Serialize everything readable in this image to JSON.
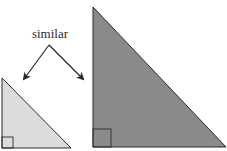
{
  "diagram": {
    "label": "similar",
    "colors": {
      "small_fill": "#dcdcdc",
      "large_fill": "#8a8a8a",
      "stroke": "#2a2a2a"
    },
    "shapes": [
      {
        "id": "small-triangle",
        "type": "right-triangle",
        "points": [
          [
            2,
            78
          ],
          [
            2,
            148
          ],
          [
            71,
            148
          ]
        ],
        "right_angle_marker": 11
      },
      {
        "id": "large-triangle",
        "type": "right-triangle",
        "points": [
          [
            93,
            7
          ],
          [
            93,
            147
          ],
          [
            226,
            147
          ]
        ],
        "right_angle_marker": 18
      }
    ],
    "arrows": [
      {
        "from": [
          49,
          45
        ],
        "to": [
          24,
          79
        ]
      },
      {
        "from": [
          49,
          45
        ],
        "to": [
          83,
          79
        ]
      }
    ]
  }
}
